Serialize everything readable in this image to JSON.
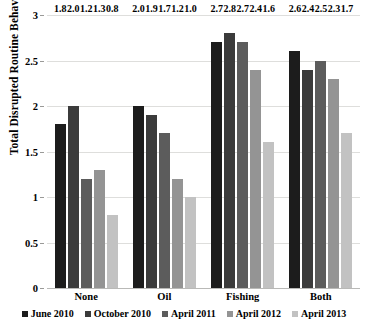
{
  "chart_data": {
    "type": "bar",
    "title": "",
    "xlabel": "",
    "ylabel": "Total Disrupted Routine Behaviors",
    "ylim": [
      0,
      3
    ],
    "yticks": [
      "0",
      "0.5",
      "1",
      "1.5",
      "2",
      "2.5",
      "3"
    ],
    "ytick_values": [
      0,
      0.5,
      1,
      1.5,
      2,
      2.5,
      3
    ],
    "grid": true,
    "legend_position": "bottom",
    "categories": [
      "None",
      "Oil",
      "Fishing",
      "Both"
    ],
    "series": [
      {
        "name": "June 2010",
        "color": "#1c1c1c",
        "values": [
          1.8,
          2.0,
          2.7,
          2.6
        ],
        "labels": [
          "1.8",
          "2.0",
          "2.7",
          "2.6"
        ]
      },
      {
        "name": "October 2010",
        "color": "#3b3b3b",
        "values": [
          2.0,
          1.9,
          2.8,
          2.4
        ],
        "labels": [
          "2.0",
          "1.9",
          "2.8",
          "2.4"
        ]
      },
      {
        "name": "April 2011",
        "color": "#5c5c5c",
        "values": [
          1.2,
          1.7,
          2.7,
          2.5
        ],
        "labels": [
          "1.2",
          "1.7",
          "2.7",
          "2.5"
        ]
      },
      {
        "name": "April 2012",
        "color": "#949494",
        "values": [
          1.3,
          1.2,
          2.4,
          2.3
        ],
        "labels": [
          "1.3",
          "1.2",
          "2.4",
          "2.3"
        ]
      },
      {
        "name": "April 2013",
        "color": "#c2c2c2",
        "values": [
          0.8,
          1.0,
          1.6,
          1.7
        ],
        "labels": [
          "0.8",
          "1.0",
          "1.6",
          "1.7"
        ]
      }
    ]
  }
}
